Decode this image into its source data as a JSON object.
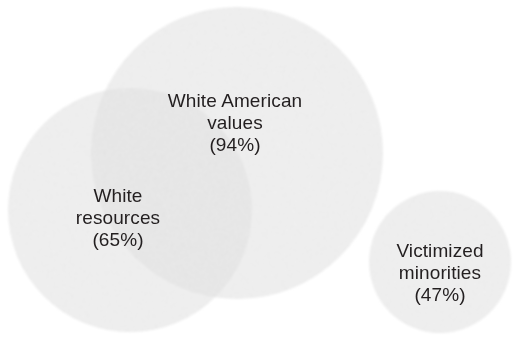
{
  "figure": {
    "type": "venn-diagram",
    "background_color": "#ffffff",
    "text_color": "#231f20"
  },
  "chart_data": {
    "type": "venn",
    "title": "",
    "xlabel": "",
    "ylabel": "",
    "legend_position": "none",
    "grid": false,
    "categories": [
      "White American values",
      "White resources",
      "Victimized minorities"
    ],
    "values": [
      94,
      65,
      47
    ],
    "value_unit": "%",
    "sets": [
      {
        "name": "White American values",
        "label_lines": [
          "White American",
          "values",
          "(94%)"
        ],
        "value": 94,
        "value_text": "(94%)",
        "fill_color": "#f6f6f6",
        "center_x": 237,
        "center_y": 153,
        "radius": 146,
        "overlaps_with": [
          "White resources"
        ]
      },
      {
        "name": "White resources",
        "label_lines": [
          "White",
          "resources",
          "(65%)"
        ],
        "value": 65,
        "value_text": "(65%)",
        "fill_color": "#f6f6f6",
        "center_x": 130,
        "center_y": 210,
        "radius": 122,
        "overlaps_with": [
          "White American values"
        ]
      },
      {
        "name": "Victimized minorities",
        "label_lines": [
          "Victimized",
          "minorities",
          "(47%)"
        ],
        "value": 47,
        "value_text": "(47%)",
        "fill_color": "#f6f6f6",
        "center_x": 440,
        "center_y": 262,
        "radius": 71,
        "overlaps_with": []
      }
    ],
    "intersection_fill_color": "#eeeeee"
  },
  "labels": {
    "white_american_values": {
      "line1": "White American",
      "line2": "values",
      "line3": "(94%)"
    },
    "white_resources": {
      "line1": "White",
      "line2": "resources",
      "line3": "(65%)"
    },
    "victimized_minorities": {
      "line1": "Victimized",
      "line2": "minorities",
      "line3": "(47%)"
    }
  }
}
